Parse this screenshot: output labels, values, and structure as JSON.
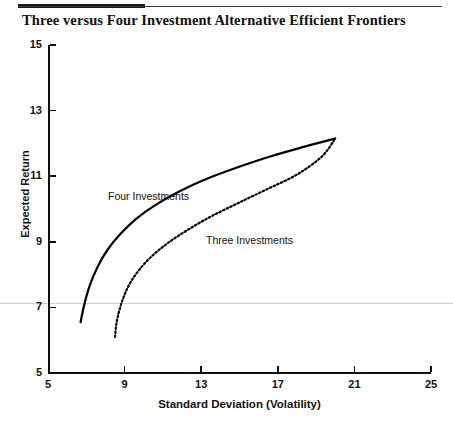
{
  "header": {
    "rule": "double-weight-horizontal-rule"
  },
  "title": "Three versus Four Investment Alternative Efficient Frontiers",
  "chart_data": {
    "type": "line",
    "title": "Three versus Four Investment Alternative Efficient Frontiers",
    "xlabel": "Standard Deviation (Volatility)",
    "ylabel": "Expected Return",
    "xlim": [
      5,
      25
    ],
    "ylim": [
      5,
      15
    ],
    "xticks": [
      5,
      9,
      13,
      17,
      21,
      25
    ],
    "yticks": [
      5,
      7,
      9,
      11,
      13,
      15
    ],
    "grid": false,
    "legend": "inline-annotations",
    "series": [
      {
        "name": "Four Investments",
        "style": "solid",
        "color": "#000000",
        "annotation": "Four Investments",
        "points": [
          [
            6.7,
            6.55
          ],
          [
            6.9,
            7.1
          ],
          [
            7.2,
            7.7
          ],
          [
            7.6,
            8.25
          ],
          [
            8.1,
            8.75
          ],
          [
            8.8,
            9.25
          ],
          [
            9.6,
            9.7
          ],
          [
            10.6,
            10.12
          ],
          [
            11.8,
            10.52
          ],
          [
            13.2,
            10.9
          ],
          [
            14.8,
            11.25
          ],
          [
            16.6,
            11.6
          ],
          [
            18.4,
            11.9
          ],
          [
            20.0,
            12.15
          ]
        ]
      },
      {
        "name": "Three Investments",
        "style": "dotted",
        "color": "#000000",
        "annotation": "Three Investments",
        "points": [
          [
            8.5,
            6.1
          ],
          [
            8.6,
            6.6
          ],
          [
            8.85,
            7.15
          ],
          [
            9.2,
            7.65
          ],
          [
            9.7,
            8.1
          ],
          [
            10.4,
            8.55
          ],
          [
            11.3,
            8.98
          ],
          [
            12.4,
            9.4
          ],
          [
            13.6,
            9.8
          ],
          [
            15.0,
            10.2
          ],
          [
            16.5,
            10.62
          ],
          [
            18.0,
            11.05
          ],
          [
            19.3,
            11.6
          ],
          [
            20.0,
            12.15
          ]
        ]
      }
    ]
  }
}
